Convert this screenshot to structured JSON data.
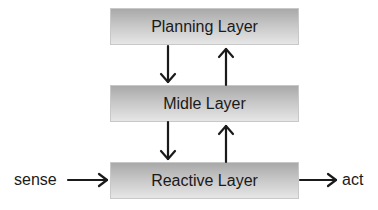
{
  "diagram": {
    "layers": [
      {
        "id": "planning",
        "label": "Planning Layer"
      },
      {
        "id": "middle",
        "label": "Midle Layer"
      },
      {
        "id": "reactive",
        "label": "Reactive Layer"
      }
    ],
    "input_label": "sense",
    "output_label": "act",
    "edges": [
      {
        "from": "Planning Layer",
        "to": "Midle Layer",
        "direction": "down"
      },
      {
        "from": "Midle Layer",
        "to": "Planning Layer",
        "direction": "up"
      },
      {
        "from": "Midle Layer",
        "to": "Reactive Layer",
        "direction": "down"
      },
      {
        "from": "Reactive Layer",
        "to": "Midle Layer",
        "direction": "up"
      },
      {
        "from": "sense",
        "to": "Reactive Layer",
        "direction": "right"
      },
      {
        "from": "Reactive Layer",
        "to": "act",
        "direction": "right"
      }
    ],
    "colors": {
      "box_top": "#a9a9a9",
      "box_bottom": "#e6e6e6",
      "arrow": "#1a1a1a"
    }
  }
}
